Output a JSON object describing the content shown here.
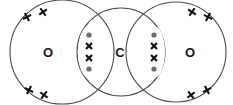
{
  "diagram": {
    "molecule": "CO2",
    "background_color": "#ffffff",
    "stroke_color": "#4a4a4a",
    "cross_color": "#111111",
    "dot_color": "#6b6b6b",
    "label_color": "#1a1a1a",
    "atoms": [
      {
        "id": "oxygen-left",
        "label": "O",
        "cx": 62,
        "cy": 52,
        "r": 52,
        "label_x": 48,
        "label_y": 52
      },
      {
        "id": "carbon-center",
        "label": "C",
        "cx": 121,
        "cy": 52,
        "r": 44,
        "label_x": 120,
        "label_y": 52
      },
      {
        "id": "oxygen-right",
        "label": "O",
        "cx": 176,
        "cy": 52,
        "r": 50,
        "label_x": 190,
        "label_y": 52
      }
    ],
    "lone_pair_crosses": [
      {
        "id": "cross-ol-tl-outer",
        "x": 27,
        "y": 17,
        "size": 6.5,
        "rotation": 18
      },
      {
        "id": "cross-ol-tl-inner",
        "x": 43,
        "y": 12,
        "size": 6.5,
        "rotation": 10
      },
      {
        "id": "cross-ol-bl-outer",
        "x": 29,
        "y": 90,
        "size": 6.5,
        "rotation": -18
      },
      {
        "id": "cross-ol-bl-inner",
        "x": 44,
        "y": 95,
        "size": 6.5,
        "rotation": -8
      },
      {
        "id": "cross-or-tr-inner",
        "x": 192,
        "y": 12,
        "size": 6.5,
        "rotation": -10
      },
      {
        "id": "cross-or-tr-outer",
        "x": 208,
        "y": 17,
        "size": 6.5,
        "rotation": -18
      },
      {
        "id": "cross-or-br-inner",
        "x": 191,
        "y": 95,
        "size": 6.5,
        "rotation": 8
      },
      {
        "id": "cross-or-br-outer",
        "x": 207,
        "y": 90,
        "size": 6.5,
        "rotation": 18
      }
    ],
    "bonds": [
      {
        "id": "bond-left-double",
        "between": "oxygen-left-carbon",
        "lens_cx": 89,
        "lens_cy": 52,
        "lens_rx": 11,
        "lens_ry": 26,
        "electrons": [
          {
            "id": "bond-left-dot-top",
            "type": "dot",
            "x": 89,
            "y": 35,
            "size": 2.6
          },
          {
            "id": "bond-left-cross-upper",
            "type": "cross",
            "x": 89,
            "y": 46,
            "size": 6.0
          },
          {
            "id": "bond-left-cross-lower",
            "type": "cross",
            "x": 89,
            "y": 58,
            "size": 6.0
          },
          {
            "id": "bond-left-dot-bottom",
            "type": "dot",
            "x": 89,
            "y": 69,
            "size": 2.6
          }
        ]
      },
      {
        "id": "bond-right-double",
        "between": "carbon-oxygen-right",
        "lens_cx": 154,
        "lens_cy": 52,
        "lens_rx": 11,
        "lens_ry": 26,
        "electrons": [
          {
            "id": "bond-right-dot-top",
            "type": "dot",
            "x": 154,
            "y": 35,
            "size": 2.6
          },
          {
            "id": "bond-right-cross-upper",
            "type": "cross",
            "x": 154,
            "y": 46,
            "size": 6.0
          },
          {
            "id": "bond-right-cross-lower",
            "type": "cross",
            "x": 154,
            "y": 58,
            "size": 6.0
          },
          {
            "id": "bond-right-dot-bottom",
            "type": "dot",
            "x": 154,
            "y": 69,
            "size": 2.6
          }
        ]
      }
    ]
  }
}
